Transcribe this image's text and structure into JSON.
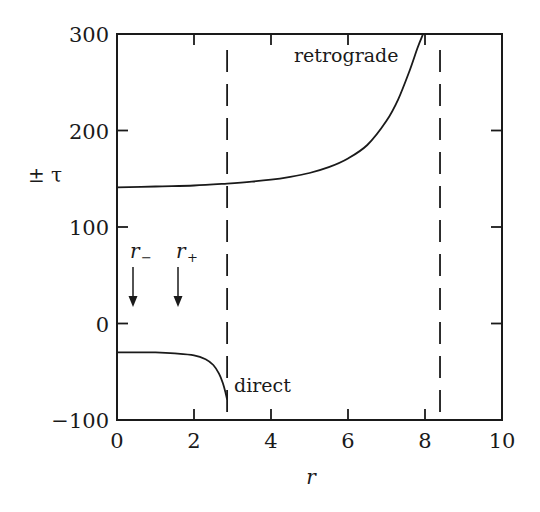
{
  "chart_data": {
    "type": "line",
    "title": "",
    "xlabel": "r",
    "ylabel": "± τ",
    "xlim": [
      0,
      10
    ],
    "ylim": [
      -100,
      300
    ],
    "grid": false,
    "legend": null,
    "x_ticks": [
      0,
      2,
      4,
      6,
      8,
      10
    ],
    "x_tick_labels": [
      "0",
      "2",
      "4",
      "6",
      "8",
      "10"
    ],
    "y_ticks": [
      -100,
      0,
      100,
      200,
      300
    ],
    "y_tick_labels": [
      "−100",
      "0",
      "100",
      "200",
      "300"
    ],
    "series": [
      {
        "name": "retrograde",
        "x": [
          0,
          1,
          2,
          2.86,
          3.5,
          4,
          4.5,
          5,
          5.5,
          6,
          6.5,
          7,
          7.3,
          7.6,
          7.8,
          7.95
        ],
        "y": [
          141,
          142,
          143,
          145,
          147,
          149,
          152,
          156,
          162,
          171,
          185,
          210,
          232,
          262,
          285,
          300
        ]
      },
      {
        "name": "direct",
        "x": [
          0,
          0.5,
          1,
          1.5,
          2,
          2.3,
          2.5,
          2.65,
          2.75,
          2.82,
          2.86
        ],
        "y": [
          -30,
          -30,
          -30,
          -31,
          -33,
          -37,
          -43,
          -52,
          -62,
          -72,
          -79
        ]
      }
    ],
    "vertical_dashed_lines": [
      2.86,
      8.39
    ],
    "annotations": [
      {
        "text": "retrograde",
        "x": 6.9,
        "y": 280
      },
      {
        "text": "direct",
        "x": 3.0,
        "y": -68
      },
      {
        "text": "r₋",
        "x": 0.35,
        "y": 85,
        "arrow_to_y": 5
      },
      {
        "text": "r₊",
        "x": 1.55,
        "y": 85,
        "arrow_to_y": 5
      }
    ]
  },
  "labels": {
    "xlabel": "r",
    "ylabel": "± τ",
    "retrograde": "retrograde",
    "direct": "direct",
    "r_minus_base": "r",
    "r_minus_sub": "−",
    "r_plus_base": "r",
    "r_plus_sub": "+"
  }
}
